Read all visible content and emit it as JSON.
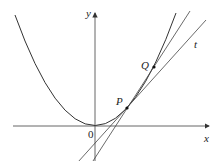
{
  "diagram": {
    "labels": {
      "y_axis": "y",
      "x_axis": "x",
      "origin": "0",
      "point_p": "P",
      "point_q": "Q",
      "tangent": "t"
    },
    "colors": {
      "stroke": "#333333",
      "axis": "#444444",
      "background": "#ffffff"
    }
  }
}
